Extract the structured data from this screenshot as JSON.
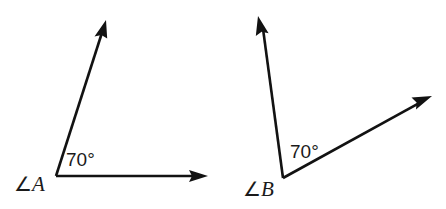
{
  "document": {
    "title": "Two 70 degree angles",
    "background_color": "#ffffff",
    "stroke_color": "#121212",
    "text_color": "#1a1a1a",
    "width": 446,
    "height": 209
  },
  "figures": [
    {
      "id": "angle-a",
      "vertex_label": "∠A",
      "vertex_label_symbol": "∠",
      "vertex_label_letter": "A",
      "measure_label": "70°",
      "measure_value": 70,
      "measure_unit": "degrees",
      "vertex": {
        "x": 56,
        "y": 176
      },
      "rays": [
        {
          "name": "horizontal-ray",
          "tip": {
            "x": 208,
            "y": 176
          },
          "direction_deg": 0
        },
        {
          "name": "upper-ray",
          "tip": {
            "x": 106,
            "y": 20
          },
          "direction_deg": 70
        }
      ],
      "measure_label_pos": {
        "x": 66,
        "y": 166
      },
      "vertex_label_pos": {
        "x": 14,
        "y": 191
      }
    },
    {
      "id": "angle-b",
      "vertex_label": "∠B",
      "vertex_label_symbol": "∠",
      "vertex_label_letter": "B",
      "measure_label": "70°",
      "measure_value": 70,
      "measure_unit": "degrees",
      "vertex": {
        "x": 283,
        "y": 178
      },
      "rays": [
        {
          "name": "left-ray",
          "tip": {
            "x": 258,
            "y": 16
          },
          "direction_deg": 99
        },
        {
          "name": "right-ray",
          "tip": {
            "x": 432,
            "y": 96
          },
          "direction_deg": 29
        }
      ],
      "measure_label_pos": {
        "x": 290,
        "y": 158
      },
      "vertex_label_pos": {
        "x": 243,
        "y": 196
      }
    }
  ]
}
